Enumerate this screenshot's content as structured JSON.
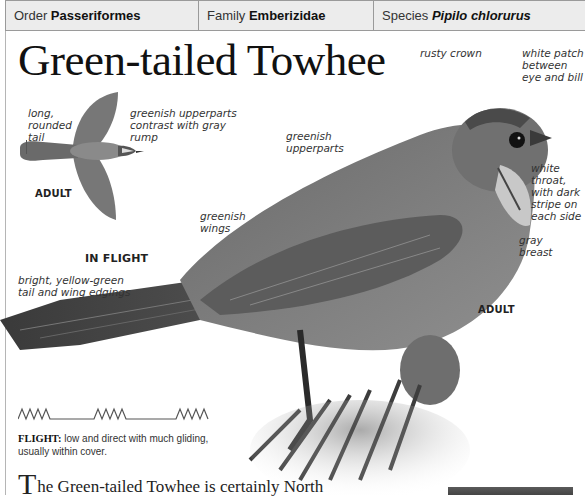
{
  "header": {
    "order_label": "Order",
    "order_value": "Passeriformes",
    "family_label": "Family",
    "family_value": "Emberizidae",
    "species_label": "Species",
    "species_value": "Pipilo chlorurus"
  },
  "title": "Green-tailed Towhee",
  "flight_illustration": {
    "annotations": {
      "tail": "long,\nrounded\ntail",
      "upperparts": "greenish upperparts\ncontrast with gray\nrump"
    },
    "age_tag": "ADULT",
    "caption": "IN FLIGHT"
  },
  "main_photo": {
    "annotations": {
      "crown": "rusty crown",
      "eye_patch": "white patch\nbetween\neye and bill",
      "upperparts": "greenish\nupperparts",
      "wings": "greenish\nwings",
      "throat": "white\nthroat,\nwith dark\nstripe on\neach side",
      "breast": "gray\nbreast",
      "tail": "bright, yellow-green\ntail and wing edgings"
    },
    "age_tag": "ADULT"
  },
  "flight": {
    "label": "FLIGHT:",
    "text": " low and direct with much gliding, usually within cover."
  },
  "intro": {
    "dropcap": "T",
    "text": "he Green-tailed Towhee is certainly North"
  }
}
